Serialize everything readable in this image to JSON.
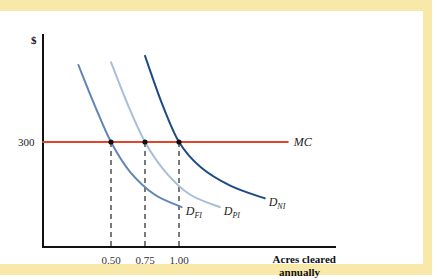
{
  "chart_data": {
    "type": "line",
    "title": "",
    "ylabel": "$",
    "xlabel_lines": [
      "Acres cleared",
      "annually"
    ],
    "ytick": {
      "value": 300,
      "label": "300"
    },
    "xticks": [
      {
        "value": 0.5,
        "label": "0.50"
      },
      {
        "value": 0.75,
        "label": "0.75"
      },
      {
        "value": 1.0,
        "label": "1.00"
      }
    ],
    "xlim": [
      0,
      2.0
    ],
    "ylim": [
      0,
      570
    ],
    "grid": false,
    "series": [
      {
        "name": "D_FI",
        "label_main": "D",
        "label_sub": "FI",
        "color": "#5f86b6",
        "points": [
          [
            0.26,
            520
          ],
          [
            0.38,
            405
          ],
          [
            0.5,
            300
          ],
          [
            0.64,
            215
          ],
          [
            0.82,
            150
          ],
          [
            1.02,
            114
          ]
        ]
      },
      {
        "name": "D_PI",
        "label_main": "D",
        "label_sub": "PI",
        "color": "#a8bfd8",
        "points": [
          [
            0.5,
            528
          ],
          [
            0.62,
            410
          ],
          [
            0.75,
            300
          ],
          [
            0.9,
            215
          ],
          [
            1.08,
            150
          ],
          [
            1.3,
            114
          ]
        ]
      },
      {
        "name": "D_NI",
        "label_main": "D",
        "label_sub": "NI",
        "color": "#1f4a86",
        "points": [
          [
            0.75,
            546
          ],
          [
            0.87,
            415
          ],
          [
            1.0,
            300
          ],
          [
            1.16,
            228
          ],
          [
            1.38,
            175
          ],
          [
            1.63,
            139
          ]
        ]
      },
      {
        "name": "MC",
        "label_main": "MC",
        "label_sub": "",
        "color": "#e2462a",
        "points": [
          [
            0.0,
            300
          ],
          [
            1.8,
            300
          ]
        ]
      }
    ],
    "equilibria": [
      {
        "series": "D_FI",
        "x": 0.5,
        "y": 300
      },
      {
        "series": "D_PI",
        "x": 0.75,
        "y": 300
      },
      {
        "series": "D_NI",
        "x": 1.0,
        "y": 300
      }
    ]
  },
  "colors": {
    "frame": "#f9e9a8",
    "axis": "#111111",
    "mc": "#e2462a"
  }
}
